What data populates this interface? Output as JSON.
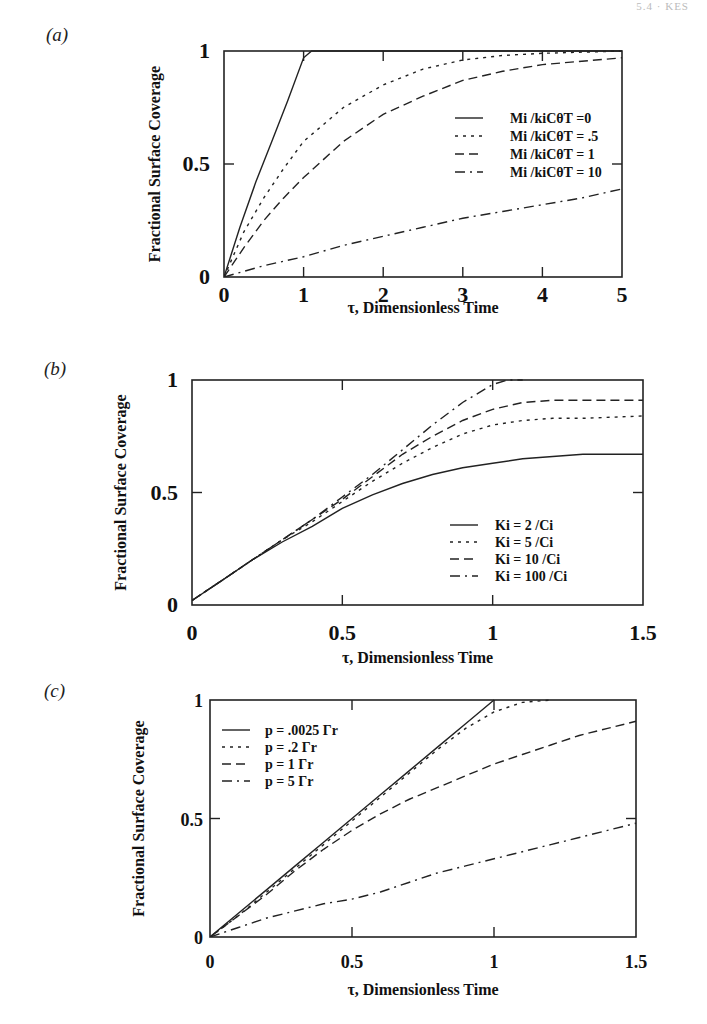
{
  "page": {
    "running_head": "5.4 · KES"
  },
  "chart_data": [
    {
      "panel": "(a)",
      "type": "line",
      "title": "",
      "xlabel": "τ, Dimensionless Time",
      "ylabel": "Fractional Surface Coverage",
      "xlim": [
        0,
        5
      ],
      "ylim": [
        0,
        1
      ],
      "xticks": [
        "0",
        "1",
        "2",
        "3",
        "4",
        "5"
      ],
      "yticks": [
        "0",
        "0.5",
        "1"
      ],
      "grid": false,
      "legend_position": "right-center",
      "series": [
        {
          "name": "Mi /kiCθT =0",
          "style": "solid",
          "x": [
            0,
            0.2,
            0.4,
            0.6,
            0.8,
            1.0,
            1.1,
            5
          ],
          "y": [
            0,
            0.22,
            0.42,
            0.6,
            0.78,
            0.97,
            1.0,
            1.0
          ]
        },
        {
          "name": "Mi /kiCθT = .5",
          "style": "dotted",
          "x": [
            0,
            0.25,
            0.5,
            0.75,
            1.0,
            1.5,
            2.0,
            2.5,
            3.0,
            3.5,
            4.0,
            5.0
          ],
          "y": [
            0,
            0.2,
            0.35,
            0.48,
            0.6,
            0.75,
            0.85,
            0.92,
            0.96,
            0.98,
            0.99,
            1.0
          ]
        },
        {
          "name": "Mi /kiCθT = 1",
          "style": "dashed",
          "x": [
            0,
            0.25,
            0.5,
            0.75,
            1.0,
            1.5,
            2.0,
            2.5,
            3.0,
            3.5,
            4.0,
            5.0
          ],
          "y": [
            0,
            0.13,
            0.25,
            0.35,
            0.44,
            0.6,
            0.72,
            0.8,
            0.87,
            0.91,
            0.94,
            0.97
          ]
        },
        {
          "name": "Mi /kiCθT = 10",
          "style": "dash-dot",
          "x": [
            0,
            0.5,
            1.0,
            1.5,
            2.0,
            2.5,
            3.0,
            3.5,
            4.0,
            4.5,
            5.0
          ],
          "y": [
            0,
            0.05,
            0.09,
            0.14,
            0.18,
            0.22,
            0.26,
            0.29,
            0.32,
            0.35,
            0.39
          ]
        }
      ]
    },
    {
      "panel": "(b)",
      "type": "line",
      "title": "",
      "xlabel": "τ, Dimensionless Time",
      "ylabel": "Fractional Surface Coverage",
      "xlim": [
        0,
        1.5
      ],
      "ylim": [
        0,
        1
      ],
      "xticks": [
        "0",
        "0.5",
        "1",
        "1.5"
      ],
      "yticks": [
        "0",
        "0.5",
        "1"
      ],
      "grid": false,
      "legend_position": "lower-right",
      "series": [
        {
          "name": "Ki = 2 /Ci",
          "style": "solid",
          "x": [
            0,
            0.1,
            0.2,
            0.3,
            0.4,
            0.5,
            0.6,
            0.7,
            0.8,
            0.9,
            1.0,
            1.1,
            1.2,
            1.3,
            1.5
          ],
          "y": [
            0.02,
            0.11,
            0.2,
            0.28,
            0.35,
            0.43,
            0.49,
            0.54,
            0.58,
            0.61,
            0.63,
            0.65,
            0.66,
            0.67,
            0.67
          ]
        },
        {
          "name": "Ki = 5 /Ci",
          "style": "dotted",
          "x": [
            0,
            0.1,
            0.2,
            0.3,
            0.4,
            0.5,
            0.6,
            0.7,
            0.8,
            0.9,
            1.0,
            1.1,
            1.2,
            1.3,
            1.5
          ],
          "y": [
            0.02,
            0.11,
            0.2,
            0.29,
            0.37,
            0.46,
            0.55,
            0.63,
            0.7,
            0.76,
            0.8,
            0.82,
            0.83,
            0.83,
            0.84
          ]
        },
        {
          "name": "Ki = 10 /Ci",
          "style": "dashed",
          "x": [
            0,
            0.1,
            0.2,
            0.3,
            0.4,
            0.5,
            0.6,
            0.7,
            0.8,
            0.9,
            1.0,
            1.1,
            1.2,
            1.3,
            1.5
          ],
          "y": [
            0.02,
            0.11,
            0.2,
            0.29,
            0.38,
            0.47,
            0.57,
            0.67,
            0.75,
            0.82,
            0.87,
            0.9,
            0.91,
            0.91,
            0.91
          ]
        },
        {
          "name": "Ki = 100 /Ci",
          "style": "dash-dot",
          "x": [
            0,
            0.1,
            0.2,
            0.3,
            0.4,
            0.5,
            0.6,
            0.7,
            0.8,
            0.9,
            1.0,
            1.05,
            1.1
          ],
          "y": [
            0.02,
            0.11,
            0.2,
            0.29,
            0.38,
            0.48,
            0.58,
            0.69,
            0.8,
            0.9,
            0.98,
            1.0,
            1.0
          ]
        }
      ]
    },
    {
      "panel": "(c)",
      "type": "line",
      "title": "",
      "xlabel": "τ, Dimensionless Time",
      "ylabel": "Fractional Surface Coverage",
      "xlim": [
        0,
        1.5
      ],
      "ylim": [
        0,
        1
      ],
      "xticks": [
        "0",
        "0.5",
        "1",
        "1.5"
      ],
      "yticks": [
        "0",
        "0.5",
        "1"
      ],
      "grid": false,
      "legend_position": "upper-left",
      "series": [
        {
          "name": "p = .0025 Γr",
          "style": "solid",
          "x": [
            0,
            0.1,
            0.2,
            0.3,
            0.4,
            0.5,
            0.6,
            0.7,
            0.8,
            0.9,
            1.0
          ],
          "y": [
            0,
            0.1,
            0.2,
            0.3,
            0.4,
            0.5,
            0.6,
            0.7,
            0.8,
            0.9,
            1.0
          ]
        },
        {
          "name": "p = .2 Γr",
          "style": "dotted",
          "x": [
            0,
            0.1,
            0.2,
            0.3,
            0.4,
            0.5,
            0.6,
            0.7,
            0.8,
            0.9,
            1.0,
            1.1,
            1.2
          ],
          "y": [
            0,
            0.09,
            0.19,
            0.29,
            0.39,
            0.49,
            0.59,
            0.69,
            0.79,
            0.88,
            0.95,
            0.99,
            1.0
          ]
        },
        {
          "name": "p = 1 Γr",
          "style": "dashed",
          "x": [
            0,
            0.1,
            0.2,
            0.3,
            0.4,
            0.5,
            0.6,
            0.7,
            0.8,
            0.9,
            1.0,
            1.1,
            1.2,
            1.3,
            1.4,
            1.5
          ],
          "y": [
            0,
            0.09,
            0.18,
            0.28,
            0.37,
            0.45,
            0.52,
            0.58,
            0.63,
            0.68,
            0.73,
            0.77,
            0.81,
            0.85,
            0.88,
            0.91
          ]
        },
        {
          "name": "p = 5 Γr",
          "style": "dash-dot",
          "x": [
            0,
            0.1,
            0.2,
            0.3,
            0.4,
            0.5,
            0.6,
            0.7,
            0.8,
            0.9,
            1.0,
            1.1,
            1.2,
            1.3,
            1.4,
            1.5
          ],
          "y": [
            0,
            0.04,
            0.08,
            0.11,
            0.14,
            0.16,
            0.19,
            0.23,
            0.27,
            0.3,
            0.33,
            0.36,
            0.39,
            0.42,
            0.45,
            0.48
          ]
        }
      ]
    }
  ]
}
